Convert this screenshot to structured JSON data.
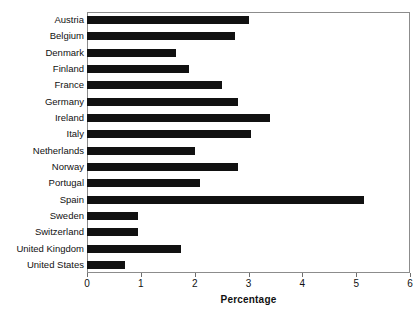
{
  "chart_data": {
    "type": "bar",
    "orientation": "horizontal",
    "title": "",
    "xlabel": "Percentage",
    "ylabel": "",
    "xlim": [
      0,
      6
    ],
    "ylim": null,
    "grid": false,
    "legend": null,
    "xticks": [
      "0",
      "1",
      "2",
      "3",
      "4",
      "5",
      "6"
    ],
    "xtick_values": [
      0,
      1,
      2,
      3,
      4,
      5,
      6
    ],
    "bar_color": "#111111",
    "frame_color": "#8c8c8c",
    "categories": [
      "Austria",
      "Belgium",
      "Denmark",
      "Finland",
      "France",
      "Germany",
      "Ireland",
      "Italy",
      "Netherlands",
      "Norway",
      "Portugal",
      "Spain",
      "Sweden",
      "Switzerland",
      "United Kingdom",
      "United States"
    ],
    "values": [
      3.0,
      2.75,
      1.65,
      1.9,
      2.5,
      2.8,
      3.4,
      3.05,
      2.0,
      2.8,
      2.1,
      5.15,
      0.95,
      0.95,
      1.75,
      0.7
    ]
  }
}
